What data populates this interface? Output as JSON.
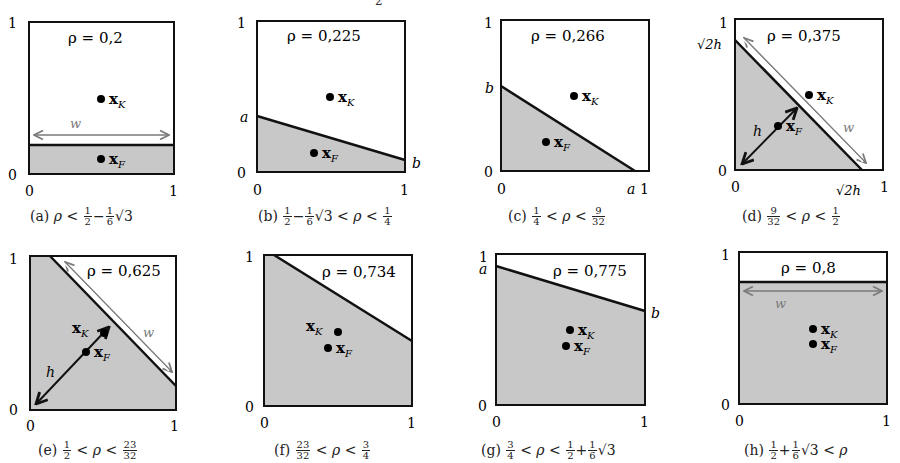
{
  "figure": {
    "top_cut_text": "2",
    "colors": {
      "shade": "#c8c8c8",
      "frame": "#111111",
      "measure_arrow": "#7a7a7a",
      "point": "#000000"
    },
    "axis_labels": {
      "zero": "0",
      "one": "1"
    },
    "points": {
      "k_label": "x",
      "k_sub": "K",
      "f_label": "x",
      "f_sub": "F"
    },
    "panels": [
      {
        "id": "a",
        "rho_label": "ρ = 0,2",
        "caption_prefix": "(a)",
        "caption": "ρ < ½ − ⅙√3",
        "extra": [
          "w"
        ]
      },
      {
        "id": "b",
        "rho_label": "ρ = 0,225",
        "caption_prefix": "(b)",
        "caption": "½ − ⅙√3 < ρ < ¼",
        "extra": [
          "a",
          "b"
        ]
      },
      {
        "id": "c",
        "rho_label": "ρ = 0,266",
        "caption_prefix": "(c)",
        "caption": "¼ < ρ < 9/32",
        "extra": [
          "a",
          "b"
        ]
      },
      {
        "id": "d",
        "rho_label": "ρ = 0,375",
        "caption_prefix": "(d)",
        "caption": "9/32 < ρ < ½",
        "extra": [
          "√2h",
          "√2h",
          "h",
          "w"
        ]
      },
      {
        "id": "e",
        "rho_label": "ρ = 0,625",
        "caption_prefix": "(e)",
        "caption": "½ < ρ < 23/32",
        "extra": [
          "h",
          "w"
        ]
      },
      {
        "id": "f",
        "rho_label": "ρ = 0,734",
        "caption_prefix": "(f)",
        "caption": "23/32 < ρ < ¾",
        "extra": []
      },
      {
        "id": "g",
        "rho_label": "ρ = 0,775",
        "caption_prefix": "(g)",
        "caption": "¾ < ρ < ½ + ⅙√3",
        "extra": [
          "a",
          "b"
        ]
      },
      {
        "id": "h",
        "rho_label": "ρ = 0,8",
        "caption_prefix": "(h)",
        "caption": "½ + ⅙√3 < ρ",
        "extra": [
          "w"
        ]
      }
    ],
    "labels": {
      "w": "w",
      "a": "a",
      "b": "b",
      "h": "h",
      "sqrt2h": "√2h"
    },
    "caption_parts": {
      "half": {
        "num": "1",
        "den": "2"
      },
      "sixth": {
        "num": "1",
        "den": "6"
      },
      "quarter": {
        "num": "1",
        "den": "4"
      },
      "three_quarters": {
        "num": "3",
        "den": "4"
      },
      "nine_32": {
        "num": "9",
        "den": "32"
      },
      "twentythree_32": {
        "num": "23",
        "den": "32"
      },
      "sqrt3": "√3",
      "rho": "ρ",
      "lt": "<",
      "minus": "−",
      "plus": "+"
    }
  }
}
